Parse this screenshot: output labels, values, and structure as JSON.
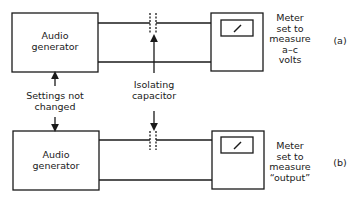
{
  "figure": {
    "diagram_a": {
      "generator_label_line1": "Audio",
      "generator_label_line2": "generator",
      "meter_caption": [
        "Meter",
        "set to",
        "measure",
        "a–c",
        "volts"
      ],
      "tag": "(a)"
    },
    "diagram_b": {
      "generator_label_line1": "Audio",
      "generator_label_line2": "generator",
      "meter_caption": [
        "Meter",
        "set to",
        "measure",
        "“output”"
      ],
      "tag": "(b)"
    },
    "annotations": {
      "settings_line1": "Settings not",
      "settings_line2": "changed",
      "capacitor_line1": "Isolating",
      "capacitor_line2": "capacitor"
    },
    "colors": {
      "stroke": "#1a1a1a",
      "background": "#ffffff"
    }
  }
}
